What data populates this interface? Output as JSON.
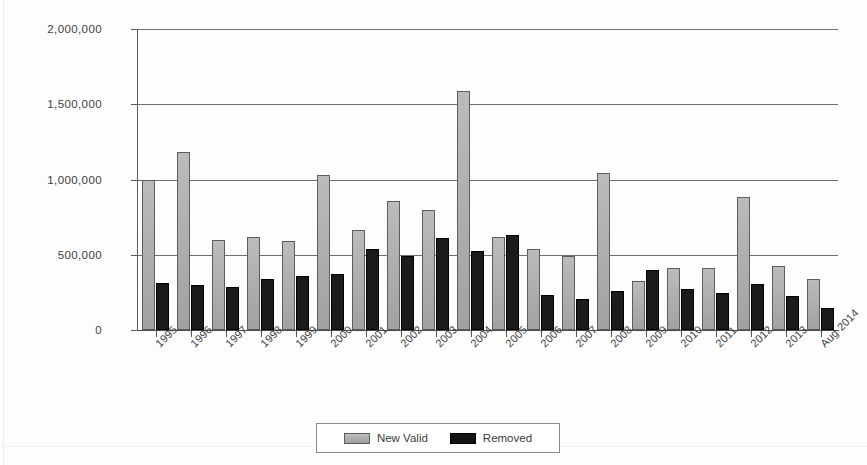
{
  "chart_data": {
    "type": "bar",
    "title": "",
    "subtitle": "",
    "xlabel": "",
    "ylabel": "",
    "grid": true,
    "legend_position": "bottom-center",
    "ylim": [
      0,
      2000000
    ],
    "ytick_labels": [
      "2,000,000",
      "1,500,000",
      "1,000,000",
      "500,000",
      "0"
    ],
    "ytick_values": [
      2000000,
      1500000,
      1000000,
      500000,
      0
    ],
    "categories": [
      "1995",
      "1996",
      "1997",
      "1998",
      "1999",
      "2000",
      "2001",
      "2002",
      "2003",
      "2004",
      "2005",
      "2006",
      "2007",
      "2008",
      "2009",
      "2010",
      "2011",
      "2012",
      "2013",
      "Aug 2014"
    ],
    "series": [
      {
        "name": "New Valid",
        "color": "#a8a8a8",
        "values": [
          1000000,
          1185000,
          595000,
          620000,
          590000,
          1030000,
          665000,
          860000,
          800000,
          1590000,
          615000,
          540000,
          495000,
          1045000,
          325000,
          415000,
          410000,
          885000,
          425000,
          340000
        ]
      },
      {
        "name": "Removed",
        "color": "#1b1b1b",
        "values": [
          310000,
          300000,
          285000,
          340000,
          360000,
          370000,
          540000,
          495000,
          610000,
          525000,
          630000,
          230000,
          205000,
          260000,
          400000,
          270000,
          245000,
          305000,
          225000,
          145000
        ]
      }
    ]
  },
  "legend": {
    "items": [
      {
        "label": "New Valid",
        "swatch": "new-valid"
      },
      {
        "label": "Removed",
        "swatch": "removed"
      }
    ]
  }
}
